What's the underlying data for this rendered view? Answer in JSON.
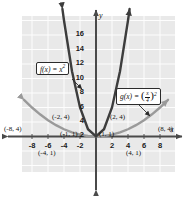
{
  "chart_data": {
    "type": "line",
    "title": "",
    "xlabel": "x",
    "ylabel": "y",
    "xlim": [
      -9.5,
      9.5
    ],
    "ylim": [
      -2.5,
      18
    ],
    "grid": true,
    "legend": "none",
    "x_ticks": [
      "-8",
      "-6",
      "-4",
      "-2",
      "2",
      "4",
      "6",
      "8"
    ],
    "x_tick_values": [
      -8,
      -6,
      -4,
      -2,
      2,
      4,
      6,
      8
    ],
    "y_ticks": [
      "16",
      "14",
      "12",
      "10",
      "8",
      "6",
      "4",
      "2"
    ],
    "y_tick_values": [
      16,
      14,
      12,
      10,
      8,
      6,
      4,
      2
    ],
    "series": [
      {
        "name": "f(x) = x^2",
        "label": "f(x) = x²",
        "color": "#3d3d3d",
        "style": "solid",
        "arrows": "both-ends-up",
        "points": [
          {
            "x": -4.2,
            "y": 17.6
          },
          {
            "x": -4,
            "y": 16
          },
          {
            "x": -3,
            "y": 9
          },
          {
            "x": -2,
            "y": 4
          },
          {
            "x": -1,
            "y": 1
          },
          {
            "x": 0,
            "y": 0
          },
          {
            "x": 1,
            "y": 1
          },
          {
            "x": 2,
            "y": 4
          },
          {
            "x": 3,
            "y": 9
          },
          {
            "x": 4,
            "y": 16
          },
          {
            "x": 4.2,
            "y": 17.6
          }
        ],
        "marked_points": [
          {
            "x": -2,
            "y": 4,
            "label": "(-2, 4)"
          },
          {
            "x": -1,
            "y": 1,
            "label": "(-1, 1)"
          },
          {
            "x": 1,
            "y": 1,
            "label": "(1, 1)"
          },
          {
            "x": 2,
            "y": 4,
            "label": "(2, 4)"
          }
        ]
      },
      {
        "name": "g(x) = (x/4)^2",
        "label": "g(x) = (x/4)²",
        "color": "#9a9a9a",
        "style": "solid",
        "arrows": "both-ends-up",
        "points": [
          {
            "x": -9,
            "y": 5.0625
          },
          {
            "x": -8,
            "y": 4
          },
          {
            "x": -7,
            "y": 3.0625
          },
          {
            "x": -6,
            "y": 2.25
          },
          {
            "x": -5,
            "y": 1.5625
          },
          {
            "x": -4,
            "y": 1
          },
          {
            "x": -3,
            "y": 0.5625
          },
          {
            "x": -2,
            "y": 0.25
          },
          {
            "x": -1,
            "y": 0.0625
          },
          {
            "x": 0,
            "y": 0
          },
          {
            "x": 1,
            "y": 0.0625
          },
          {
            "x": 2,
            "y": 0.25
          },
          {
            "x": 3,
            "y": 0.5625
          },
          {
            "x": 4,
            "y": 1
          },
          {
            "x": 5,
            "y": 1.5625
          },
          {
            "x": 6,
            "y": 2.25
          },
          {
            "x": 7,
            "y": 3.0625
          },
          {
            "x": 8,
            "y": 4
          },
          {
            "x": 9,
            "y": 5.0625
          }
        ],
        "marked_points": [
          {
            "x": -8,
            "y": 4,
            "label": "(-8, 4)"
          },
          {
            "x": -4,
            "y": 1,
            "label": "(-4, 1)"
          },
          {
            "x": 4,
            "y": 1,
            "label": "(4, 1)"
          },
          {
            "x": 8,
            "y": 4,
            "label": "(8, 4)"
          }
        ]
      }
    ]
  },
  "callouts": {
    "fx": {
      "text": "f(x) = x²",
      "fn_name": "f",
      "var": "x",
      "equals": "=",
      "body": "x",
      "exponent": "2"
    },
    "gx": {
      "text": "g(x) = (x/4)²",
      "fn_name": "g",
      "var": "x",
      "equals": "=",
      "numerator": "x",
      "denominator": "4",
      "exponent": "2"
    }
  },
  "point_labels": {
    "neg8_4": "(-8, 4)",
    "neg4_1": "(-4, 1)",
    "neg2_4": "(-2, 4)",
    "neg1_1": "(-1, 1)",
    "pos1_1": "(1, 1)",
    "pos2_4": "(2, 4)",
    "pos4_1": "(4, 1)",
    "pos8_4": "(8, 4)"
  },
  "axis_names": {
    "x": "x",
    "y": "y"
  },
  "colors": {
    "plot_background": "#e9e9e9",
    "gridline": "#ffffff",
    "axis": "#4a4a4a",
    "f_curve": "#3d3d3d",
    "g_curve": "#9a9a9a",
    "text": "#111111",
    "callout_border": "#2b2b2b"
  }
}
